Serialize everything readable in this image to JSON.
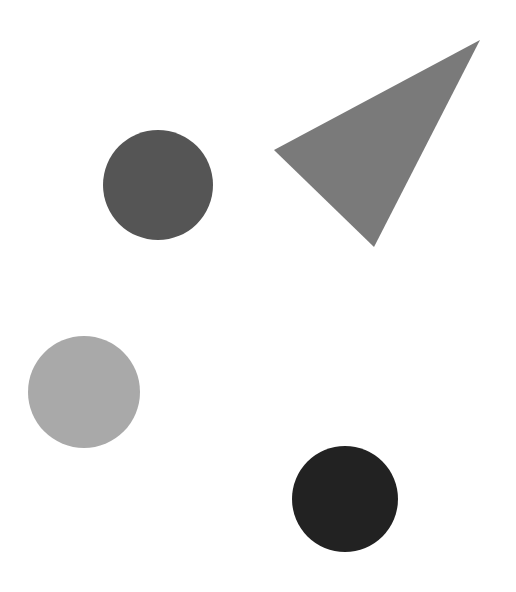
{
  "canvas": {
    "width": 516,
    "height": 592,
    "background": "#ffffff"
  },
  "shapes": [
    {
      "type": "circle",
      "name": "dark-gray-circle",
      "cx": 158,
      "cy": 185,
      "r": 55,
      "color": "#555555"
    },
    {
      "type": "triangle",
      "name": "gray-triangle",
      "points": "480,40 274,150 374,247",
      "color": "#7a7a7a"
    },
    {
      "type": "circle",
      "name": "light-gray-circle",
      "cx": 84,
      "cy": 392,
      "r": 56,
      "color": "#a9a9a9"
    },
    {
      "type": "circle",
      "name": "black-circle",
      "cx": 345,
      "cy": 499,
      "r": 53,
      "color": "#222222"
    }
  ]
}
